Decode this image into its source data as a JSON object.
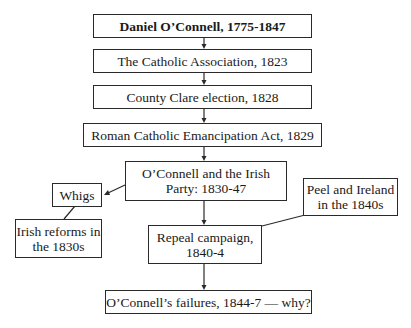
{
  "diagram": {
    "type": "flowchart",
    "nodes": [
      {
        "id": "oconnell",
        "label": "Daniel O’Connell, 1775-1847",
        "bold": true
      },
      {
        "id": "association",
        "label": "The Catholic Association, 1823"
      },
      {
        "id": "clare",
        "label": "County Clare election, 1828"
      },
      {
        "id": "emancipation",
        "label": "Roman Catholic Emancipation Act, 1829"
      },
      {
        "id": "party",
        "lines": [
          "O’Connell and the Irish",
          "Party: 1830-47"
        ]
      },
      {
        "id": "whigs",
        "label": "Whigs"
      },
      {
        "id": "reforms",
        "lines": [
          "Irish reforms in",
          "the 1830s"
        ]
      },
      {
        "id": "peel",
        "lines": [
          "Peel and Ireland",
          "in the 1840s"
        ]
      },
      {
        "id": "repeal",
        "lines": [
          "Repeal campaign,",
          "1840-4"
        ]
      },
      {
        "id": "failures",
        "label": "O’Connell’s failures, 1844-7 — why?"
      }
    ],
    "edges": [
      {
        "from": "oconnell",
        "to": "association",
        "arrow": true
      },
      {
        "from": "association",
        "to": "clare",
        "arrow": true
      },
      {
        "from": "clare",
        "to": "emancipation",
        "arrow": true
      },
      {
        "from": "emancipation",
        "to": "party",
        "arrow": true
      },
      {
        "from": "party",
        "to": "whigs",
        "arrow": true
      },
      {
        "from": "whigs",
        "to": "reforms",
        "arrow": false
      },
      {
        "from": "party",
        "to": "repeal",
        "arrow": true
      },
      {
        "from": "peel",
        "to": "repeal",
        "arrow": false
      },
      {
        "from": "repeal",
        "to": "failures",
        "arrow": true
      }
    ]
  }
}
